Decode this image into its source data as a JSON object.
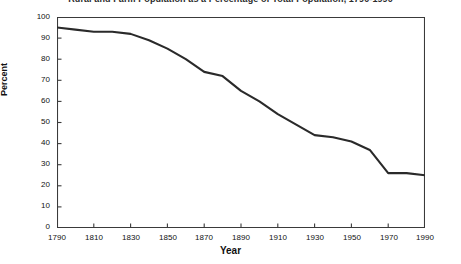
{
  "chart_data": {
    "type": "line",
    "title": "Rural and Farm Population as a Percentage of Total Population, 1790-1990",
    "xlabel": "Year",
    "ylabel": "Percent",
    "xlim": [
      1790,
      1990
    ],
    "ylim": [
      0,
      100
    ],
    "grid": false,
    "legend": "none",
    "x_ticks": [
      "1790",
      "1810",
      "1830",
      "1850",
      "1870",
      "1890",
      "1910",
      "1930",
      "1950",
      "1970",
      "1990"
    ],
    "y_ticks": [
      "0",
      "10",
      "20",
      "30",
      "40",
      "50",
      "60",
      "70",
      "80",
      "90",
      "100"
    ],
    "line_color": "#2a2a2a",
    "axis_color": "#3a3a3a",
    "series": [
      {
        "name": "Rural population percent",
        "x": [
          1790,
          1800,
          1810,
          1820,
          1830,
          1840,
          1850,
          1860,
          1870,
          1880,
          1890,
          1900,
          1910,
          1920,
          1930,
          1940,
          1950,
          1960,
          1970,
          1980,
          1990
        ],
        "values": [
          95,
          94,
          93,
          93,
          92,
          89,
          85,
          80,
          74,
          72,
          65,
          60,
          54,
          49,
          44,
          43,
          41,
          37,
          26,
          26,
          25
        ]
      }
    ]
  }
}
